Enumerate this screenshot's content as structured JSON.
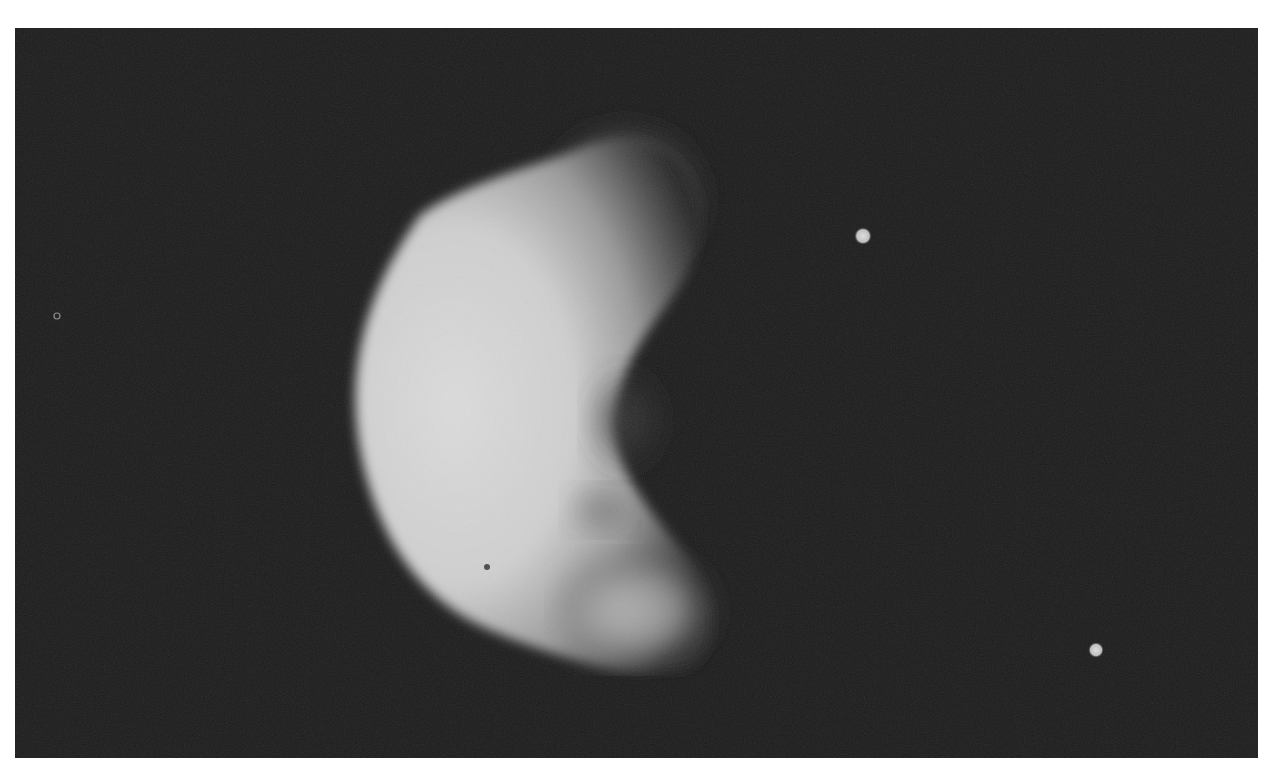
{
  "image": {
    "description": "Grayscale halftone photograph of an irregular crescent-lit moon against a black sky",
    "background_color": "#ffffff",
    "sky_color": "#1c1c1c",
    "body": {
      "lit_color": "#d6d6d6",
      "mid_color": "#9a9a9a",
      "shadow_color": "#2a2a2a"
    },
    "points": [
      {
        "name": "bright-dot-upper",
        "x": 863,
        "y": 236,
        "r": 8,
        "color": "#d0d0d0"
      },
      {
        "name": "bright-dot-lower",
        "x": 1096,
        "y": 650,
        "r": 7,
        "color": "#c8c8c8"
      },
      {
        "name": "faint-ring-left",
        "x": 57,
        "y": 316,
        "r": 3,
        "color": "#9a9a9a"
      }
    ]
  }
}
